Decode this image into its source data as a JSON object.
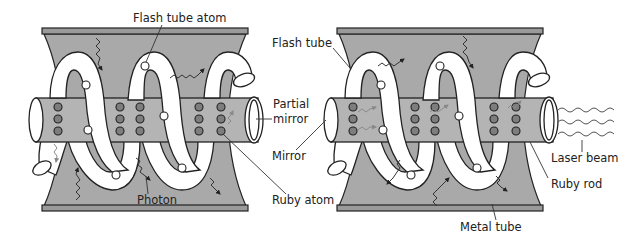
{
  "figure": {
    "panels": [
      {
        "id": "left",
        "labels": {
          "flash_tube_atom": "Flash tube atom",
          "partial_mirror_line1": "Partial",
          "partial_mirror_line2": "mirror",
          "photon": "Photon",
          "ruby_atom": "Ruby atom"
        }
      },
      {
        "id": "right",
        "labels": {
          "flash_tube": "Flash tube",
          "mirror": "Mirror",
          "laser_beam": "Laser beam",
          "ruby_rod": "Ruby rod",
          "metal_tube": "Metal tube"
        }
      }
    ],
    "colors": {
      "metal_tube": "#a9a9a9",
      "ruby_rod": "#b4b4b4",
      "ruby_atom": "#7d7d7d",
      "flash_tube": "#ffffff",
      "outline": "#222222"
    },
    "components": {
      "ruby_atoms_per_column": 3,
      "ruby_atom_columns": 5
    }
  }
}
